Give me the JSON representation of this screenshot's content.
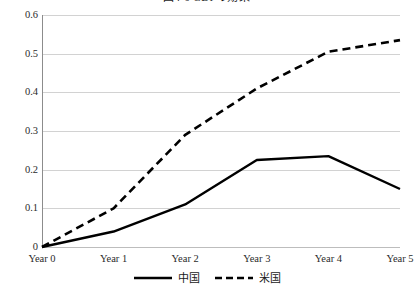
{
  "chart_data": {
    "type": "line",
    "title": "図4-6 GDPの効果",
    "xlabel": "",
    "ylabel": "",
    "categories": [
      "Year 0",
      "Year 1",
      "Year 2",
      "Year 3",
      "Year 4",
      "Year 5"
    ],
    "ylim": [
      0,
      0.6
    ],
    "yticks": [
      "0",
      "0.1",
      "0.2",
      "0.3",
      "0.4",
      "0.5",
      "0.6"
    ],
    "ytick_values": [
      0,
      0.1,
      0.2,
      0.3,
      0.4,
      0.5,
      0.6
    ],
    "grid": true,
    "legend_position": "bottom-center",
    "series": [
      {
        "name": "中国",
        "style": "solid",
        "color": "#000000",
        "values": [
          0,
          0.04,
          0.11,
          0.225,
          0.235,
          0.15
        ]
      },
      {
        "name": "米国",
        "style": "dashed",
        "color": "#000000",
        "values": [
          0,
          0.1,
          0.29,
          0.41,
          0.505,
          0.535
        ]
      }
    ]
  },
  "legend": {
    "items": [
      {
        "label": "中国",
        "style": "solid"
      },
      {
        "label": "米国",
        "style": "dashed"
      }
    ]
  }
}
